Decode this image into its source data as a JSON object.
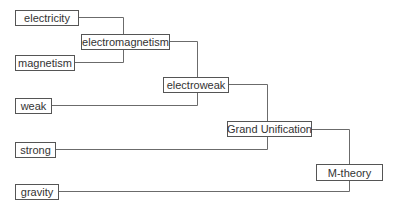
{
  "diagram": {
    "type": "unification-tree",
    "line_color": "#6b6b6b",
    "nodes": {
      "electricity": "electricity",
      "magnetism": "magnetism",
      "electromagnetism": "electromagnetism",
      "weak": "weak",
      "electroweak": "electroweak",
      "strong": "strong",
      "grand_unification": "Grand Unification",
      "gravity": "gravity",
      "m_theory": "M-theory"
    },
    "edges": [
      [
        "electricity",
        "electromagnetism"
      ],
      [
        "magnetism",
        "electromagnetism"
      ],
      [
        "electromagnetism",
        "electroweak"
      ],
      [
        "weak",
        "electroweak"
      ],
      [
        "electroweak",
        "grand_unification"
      ],
      [
        "strong",
        "grand_unification"
      ],
      [
        "grand_unification",
        "m_theory"
      ],
      [
        "gravity",
        "m_theory"
      ]
    ]
  }
}
